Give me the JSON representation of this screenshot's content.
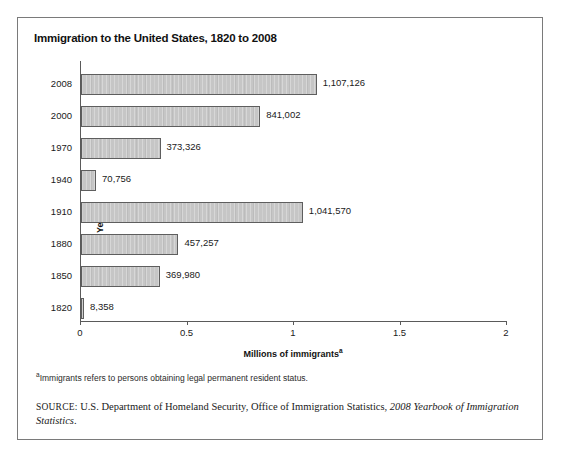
{
  "figure": {
    "title": "Immigration to the United States, 1820 to 2008",
    "footnote_marker": "a",
    "footnote_text": "Immigrants refers to persons obtaining legal permanent resident status.",
    "source_label": "SOURCE:",
    "source_text": " U.S. Department of Homeland Security, Office of Immigration Statistics, ",
    "source_title": "2008 Yearbook of Immigration Statistics",
    "source_end": "."
  },
  "chart_data": {
    "type": "bar",
    "orientation": "horizontal",
    "title": "Immigration to the United States, 1820 to 2008",
    "xlabel": "Millions of immigrants",
    "xlabel_superscript": "a",
    "ylabel": "Year",
    "xlim": [
      0,
      2
    ],
    "x_unit": "millions",
    "grid": false,
    "legend": "none",
    "xticks": [
      "0",
      "0.5",
      "1",
      "1.5",
      "2"
    ],
    "xtick_values": [
      0,
      0.5,
      1,
      1.5,
      2
    ],
    "categories": [
      "2008",
      "2000",
      "1970",
      "1940",
      "1910",
      "1880",
      "1850",
      "1820"
    ],
    "values": [
      1107126,
      841002,
      373326,
      70756,
      1041570,
      457257,
      369980,
      8358
    ],
    "value_labels": [
      "1,107,126",
      "841,002",
      "373,326",
      "70,756",
      "1,041,570",
      "457,257",
      "369,980",
      "8,358"
    ],
    "bars": [
      {
        "year": "2008",
        "value": 1107126,
        "label": "1,107,126"
      },
      {
        "year": "2000",
        "value": 841002,
        "label": "841,002"
      },
      {
        "year": "1970",
        "value": 373326,
        "label": "373,326"
      },
      {
        "year": "1940",
        "value": 70756,
        "label": "70,756"
      },
      {
        "year": "1910",
        "value": 1041570,
        "label": "1,041,570"
      },
      {
        "year": "1880",
        "value": 457257,
        "label": "457,257"
      },
      {
        "year": "1850",
        "value": 369980,
        "label": "369,980"
      },
      {
        "year": "1820",
        "value": 8358,
        "label": "8,358"
      }
    ],
    "bar_color": "#c6c6c6",
    "bar_border_color": "#5e5e5e"
  }
}
